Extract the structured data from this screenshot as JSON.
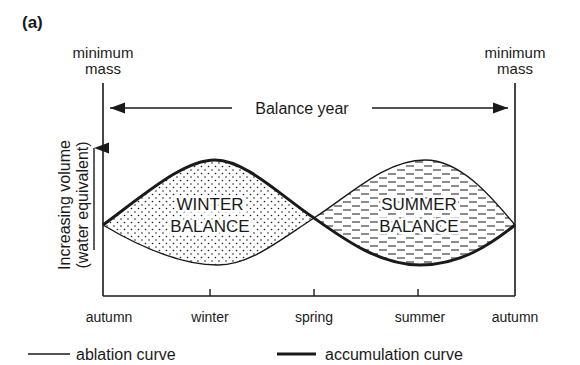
{
  "figure_label": "(a)",
  "left_marker": {
    "line1": "minimum",
    "line2": "mass"
  },
  "right_marker": {
    "line1": "minimum",
    "line2": "mass"
  },
  "balance_year_label": "Balance year",
  "y_axis": {
    "line1": "Increasing volume",
    "line2": "(water equivalent)"
  },
  "x_ticks": [
    "autumn",
    "winter",
    "spring",
    "summer",
    "autumn"
  ],
  "regions": {
    "winter": {
      "line1": "WINTER",
      "line2": "BALANCE",
      "fill": "dotted"
    },
    "summer": {
      "line1": "SUMMER",
      "line2": "BALANCE",
      "fill": "dashed"
    }
  },
  "legend": {
    "ablation": "ablation curve",
    "accumulation": "accumulation curve"
  },
  "colors": {
    "ink": "#1a1a1a",
    "background": "#ffffff"
  }
}
